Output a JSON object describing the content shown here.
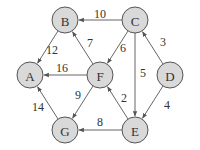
{
  "diagram": {
    "type": "directed-weighted-graph",
    "nodes": [
      {
        "id": "A",
        "label": "A",
        "x": 30,
        "y": 75
      },
      {
        "id": "B",
        "label": "B",
        "x": 65,
        "y": 20
      },
      {
        "id": "C",
        "label": "C",
        "x": 135,
        "y": 20
      },
      {
        "id": "D",
        "label": "D",
        "x": 170,
        "y": 75
      },
      {
        "id": "E",
        "label": "E",
        "x": 135,
        "y": 130
      },
      {
        "id": "F",
        "label": "F",
        "x": 100,
        "y": 75
      },
      {
        "id": "G",
        "label": "G",
        "x": 65,
        "y": 130
      }
    ],
    "edges": [
      {
        "from": "C",
        "to": "B",
        "weight": "10",
        "lx": 100,
        "ly": 14
      },
      {
        "from": "B",
        "to": "A",
        "weight": "12",
        "lx": 52,
        "ly": 50
      },
      {
        "from": "F",
        "to": "B",
        "weight": "7",
        "lx": 90,
        "ly": 43
      },
      {
        "from": "C",
        "to": "F",
        "weight": "6",
        "lx": 123,
        "ly": 48
      },
      {
        "from": "C",
        "to": "E",
        "weight": "5",
        "lx": 143,
        "ly": 73
      },
      {
        "from": "D",
        "to": "C",
        "weight": "3",
        "lx": 163,
        "ly": 42
      },
      {
        "from": "F",
        "to": "A",
        "weight": "16",
        "lx": 62,
        "ly": 68
      },
      {
        "from": "F",
        "to": "G",
        "weight": "9",
        "lx": 78,
        "ly": 95
      },
      {
        "from": "E",
        "to": "F",
        "weight": "2",
        "lx": 124,
        "ly": 98
      },
      {
        "from": "D",
        "to": "E",
        "weight": "4",
        "lx": 167,
        "ly": 105
      },
      {
        "from": "E",
        "to": "G",
        "weight": "8",
        "lx": 100,
        "ly": 122
      },
      {
        "from": "G",
        "to": "A",
        "weight": "14",
        "lx": 38,
        "ly": 107
      }
    ],
    "colors": {
      "node_fill": "#d9d9d9",
      "stroke": "#555555",
      "text": "#333333"
    }
  }
}
